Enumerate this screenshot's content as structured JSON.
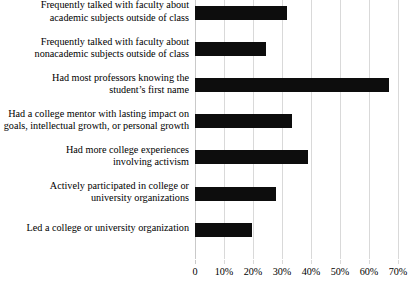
{
  "chart_data": {
    "type": "bar",
    "orientation": "horizontal",
    "title": "",
    "subtitle": "",
    "xlabel": "",
    "ylabel": "",
    "xlim": [
      0,
      70
    ],
    "ylim": null,
    "grid": true,
    "legend": null,
    "legend_position": "none",
    "bar_color": "#0d0d0d",
    "gridline_color": "#d9d9d9",
    "background_color": "#ffffff",
    "xticks": [
      0,
      10,
      20,
      30,
      40,
      50,
      60,
      70
    ],
    "xtick_labels": [
      "0",
      "10%",
      "20%",
      "30%",
      "40%",
      "50%",
      "60%",
      "70%"
    ],
    "categories": [
      "Frequently talked with faculty about academic subjects outside of class",
      "Frequently talked with faculty about nonacademic subjects outside of class",
      "Had most professors knowing the student’s first name",
      "Had a college mentor with lasting impact on goals, intellectual growth, or personal growth",
      "Had more college experiences involving activism",
      "Actively participated in college or university organizations",
      "Led a college or university organization"
    ],
    "category_lines": [
      [
        "Frequently talked with faculty about",
        "academic subjects outside of class"
      ],
      [
        "Frequently talked with faculty about",
        "nonacademic subjects outside of class"
      ],
      [
        "Had most professors knowing the",
        "student’s first name"
      ],
      [
        "Had a college mentor with lasting impact on",
        "goals, intellectual growth, or personal growth"
      ],
      [
        "Had more college experiences",
        "involving activism"
      ],
      [
        "Actively participated in college or",
        "university organizations"
      ],
      [
        "Led a college or university organization"
      ]
    ],
    "values": [
      31.8,
      24.6,
      66.9,
      33.6,
      39.0,
      27.8,
      19.8
    ],
    "value_unit": "%"
  }
}
